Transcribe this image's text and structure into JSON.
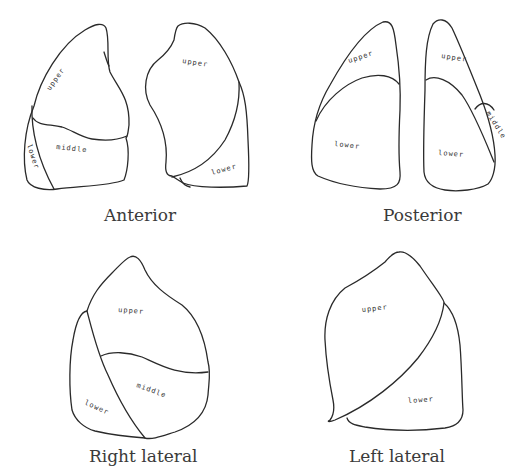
{
  "figure": {
    "views": [
      {
        "id": "anterior",
        "caption": "Anterior",
        "lungs": [
          {
            "side": "right",
            "lobes": [
              "upper",
              "middle",
              "lower"
            ]
          },
          {
            "side": "left",
            "lobes": [
              "upper",
              "lower"
            ]
          }
        ]
      },
      {
        "id": "posterior",
        "caption": "Posterior",
        "lungs": [
          {
            "side": "left",
            "lobes": [
              "upper",
              "lower"
            ]
          },
          {
            "side": "right",
            "lobes": [
              "upper",
              "middle",
              "lower"
            ]
          }
        ]
      },
      {
        "id": "right-lateral",
        "caption": "Right lateral",
        "lungs": [
          {
            "side": "right",
            "lobes": [
              "upper",
              "middle",
              "lower"
            ]
          }
        ]
      },
      {
        "id": "left-lateral",
        "caption": "Left lateral",
        "lungs": [
          {
            "side": "left",
            "lobes": [
              "upper",
              "lower"
            ]
          }
        ]
      }
    ]
  },
  "labels": {
    "upper": "upper",
    "middle": "middle",
    "lower": "lower"
  },
  "colors": {
    "line": "#2a2a2a",
    "text": "#333333",
    "background": "#ffffff"
  }
}
